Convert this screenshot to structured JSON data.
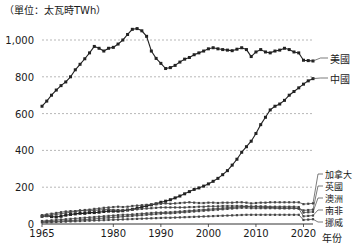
{
  "chart_data": {
    "type": "line",
    "title": "（單位：太瓦時TWh）",
    "xlabel": "年份",
    "ylabel": "",
    "unit": "太瓦時TWh",
    "grid": true,
    "legend_position": "right-inline",
    "xlim": [
      1965,
      2022
    ],
    "ylim": [
      0,
      1100
    ],
    "yticks": [
      0,
      200,
      400,
      600,
      800,
      1000
    ],
    "ytick_labels": [
      "0",
      "200",
      "400",
      "600",
      "800",
      "1,000"
    ],
    "xticks": [
      1965,
      1980,
      1990,
      2000,
      2010,
      2020
    ],
    "xtick_labels": [
      "1965",
      "1980",
      "1990",
      "2000",
      "2010",
      "2020"
    ],
    "x": [
      1965,
      1966,
      1967,
      1968,
      1969,
      1970,
      1971,
      1972,
      1973,
      1974,
      1975,
      1976,
      1977,
      1978,
      1979,
      1980,
      1981,
      1982,
      1983,
      1984,
      1985,
      1986,
      1987,
      1988,
      1989,
      1990,
      1991,
      1992,
      1993,
      1994,
      1995,
      1996,
      1997,
      1998,
      1999,
      2000,
      2001,
      2002,
      2003,
      2004,
      2005,
      2006,
      2007,
      2008,
      2009,
      2010,
      2011,
      2012,
      2013,
      2014,
      2015,
      2016,
      2017,
      2018,
      2019,
      2020,
      2021,
      2022
    ],
    "series": [
      {
        "name": "美國",
        "name_en": "United States",
        "color": "#222222",
        "label_y_value": 880,
        "values": [
          640,
          668,
          700,
          728,
          752,
          772,
          800,
          838,
          868,
          898,
          930,
          965,
          955,
          940,
          955,
          960,
          978,
          1000,
          1030,
          1058,
          1062,
          1050,
          1020,
          940,
          900,
          873,
          845,
          850,
          862,
          880,
          896,
          905,
          920,
          930,
          940,
          952,
          958,
          952,
          948,
          945,
          942,
          950,
          958,
          948,
          910,
          935,
          948,
          935,
          930,
          940,
          945,
          955,
          948,
          935,
          930,
          890,
          888,
          886
        ],
        "values_label": "美國"
      },
      {
        "name": "中國",
        "name_en": "China",
        "color": "#222222",
        "label_y_value": 790,
        "values": [
          42,
          45,
          40,
          38,
          42,
          48,
          52,
          55,
          58,
          58,
          62,
          62,
          64,
          68,
          70,
          70,
          70,
          72,
          76,
          80,
          86,
          92,
          98,
          104,
          110,
          118,
          124,
          132,
          142,
          152,
          164,
          176,
          188,
          196,
          206,
          218,
          232,
          248,
          268,
          290,
          320,
          352,
          390,
          420,
          450,
          492,
          540,
          580,
          620,
          640,
          652,
          672,
          700,
          720,
          740,
          760,
          778,
          790
        ],
        "values_label": "中國"
      },
      {
        "name": "加拿大",
        "name_en": "Canada",
        "color": "#444444",
        "label_y_value": 108,
        "values": [
          40,
          44,
          48,
          52,
          56,
          60,
          64,
          68,
          72,
          76,
          78,
          82,
          84,
          88,
          90,
          92,
          94,
          92,
          94,
          98,
          100,
          102,
          104,
          106,
          108,
          110,
          112,
          110,
          112,
          114,
          116,
          118,
          116,
          114,
          114,
          116,
          116,
          114,
          116,
          116,
          116,
          118,
          118,
          116,
          112,
          114,
          116,
          116,
          118,
          118,
          118,
          118,
          118,
          118,
          118,
          108,
          110,
          112
        ],
        "values_label": "加拿大"
      },
      {
        "name": "英國",
        "name_en": "United Kingdom",
        "color": "#444444",
        "label_y_value": 84,
        "values": [
          48,
          52,
          56,
          60,
          64,
          68,
          70,
          70,
          74,
          72,
          72,
          74,
          76,
          78,
          80,
          76,
          76,
          74,
          76,
          78,
          80,
          82,
          84,
          86,
          88,
          90,
          90,
          90,
          90,
          90,
          90,
          92,
          92,
          94,
          94,
          96,
          96,
          96,
          98,
          98,
          98,
          98,
          98,
          96,
          92,
          94,
          92,
          90,
          90,
          88,
          86,
          86,
          86,
          86,
          84,
          74,
          76,
          78
        ],
        "values_label": "英國"
      },
      {
        "name": "澳洲",
        "name_en": "Australia",
        "color": "#444444",
        "label_y_value": 62,
        "values": [
          16,
          18,
          20,
          22,
          24,
          26,
          28,
          30,
          32,
          34,
          36,
          38,
          40,
          42,
          44,
          46,
          48,
          50,
          50,
          52,
          54,
          56,
          58,
          60,
          62,
          62,
          64,
          64,
          66,
          68,
          70,
          72,
          74,
          76,
          78,
          80,
          82,
          84,
          86,
          88,
          90,
          92,
          94,
          96,
          96,
          96,
          96,
          96,
          94,
          94,
          94,
          94,
          94,
          94,
          92,
          62,
          64,
          66
        ],
        "values_label": "澳洲"
      },
      {
        "name": "南非",
        "name_en": "South Africa",
        "color": "#444444",
        "label_y_value": 42,
        "values": [
          12,
          13,
          14,
          15,
          16,
          18,
          19,
          20,
          22,
          24,
          26,
          28,
          30,
          32,
          34,
          36,
          38,
          40,
          42,
          44,
          46,
          48,
          50,
          52,
          54,
          56,
          58,
          58,
          60,
          62,
          64,
          66,
          68,
          70,
          72,
          74,
          76,
          78,
          80,
          82,
          84,
          86,
          88,
          88,
          86,
          86,
          86,
          86,
          86,
          86,
          86,
          86,
          86,
          86,
          84,
          42,
          44,
          46
        ],
        "values_label": "南非"
      },
      {
        "name": "挪威",
        "name_en": "Norway",
        "color": "#444444",
        "label_y_value": 22,
        "values": [
          8,
          9,
          10,
          11,
          12,
          13,
          14,
          15,
          16,
          17,
          18,
          19,
          20,
          21,
          22,
          23,
          24,
          25,
          26,
          27,
          28,
          29,
          30,
          31,
          32,
          33,
          34,
          34,
          35,
          36,
          37,
          38,
          39,
          40,
          41,
          42,
          43,
          44,
          45,
          46,
          47,
          48,
          49,
          50,
          50,
          50,
          50,
          50,
          50,
          50,
          50,
          50,
          50,
          50,
          50,
          22,
          24,
          26
        ],
        "values_label": "挪威"
      }
    ]
  },
  "labels": {
    "unit_title": "（單位：太瓦時TWh）",
    "x_axis_name": "年份",
    "us": "美國",
    "china": "中國",
    "canada": "加拿大",
    "uk": "英國",
    "australia": "澳洲",
    "south_africa": "南非",
    "norway": "挪威"
  }
}
